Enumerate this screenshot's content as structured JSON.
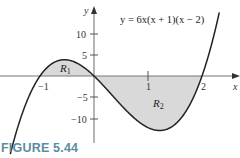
{
  "figure": {
    "label": "FIGURE 5.44",
    "label_color": "#5b8ca0",
    "equation": "y = 6x(x + 1)(x − 2)",
    "axis_x_label": "x",
    "axis_y_label": "y",
    "region_labels": [
      "R1",
      "R2"
    ],
    "shade_color": "#d9d9d9",
    "curve_color": "#222222",
    "axis_color": "#777777"
  },
  "chart_data": {
    "type": "line",
    "title": "",
    "equation": "y = 6x(x + 1)(x − 2)",
    "xlabel": "x",
    "ylabel": "y",
    "xlim": [
      -1.75,
      2.65
    ],
    "ylim": [
      -15.5,
      15.5
    ],
    "x_ticks": [
      -1,
      1,
      2
    ],
    "y_ticks": [
      10,
      5,
      -5,
      -10
    ],
    "grid": false,
    "legend": null,
    "annotations": [
      {
        "text": "R1",
        "x": -0.5,
        "y": 2,
        "desc": "shaded region between curve and x-axis on [-1, 0], above axis"
      },
      {
        "text": "R2",
        "x": 1.1,
        "y": -6.5,
        "desc": "shaded region between curve and x-axis on [0, 2], below axis"
      }
    ],
    "series": [
      {
        "name": "y = 6x(x+1)(x-2)",
        "x": [
          -1.5,
          -1.25,
          -1.0,
          -0.75,
          -0.55,
          -0.5,
          -0.25,
          0.0,
          0.25,
          0.5,
          0.75,
          1.0,
          1.215,
          1.25,
          1.5,
          1.75,
          2.0,
          2.25
        ],
        "values": [
          -15.75,
          -6.09,
          0.0,
          3.09,
          4.06,
          4.5,
          3.38,
          0.0,
          -3.28,
          -6.75,
          -9.84,
          -12.0,
          -12.6,
          -12.66,
          -11.25,
          -7.22,
          0.0,
          10.97
        ]
      }
    ],
    "roots": [
      -1,
      0,
      2
    ],
    "local_max": {
      "x": -0.55,
      "y": 4.06
    },
    "local_min": {
      "x": 1.215,
      "y": -12.6
    }
  }
}
